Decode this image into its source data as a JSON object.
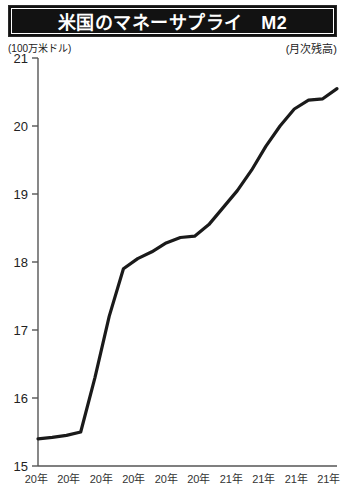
{
  "header": {
    "title": "米国のマネーサプライ　M2",
    "unit_left": "(100万米ドル)",
    "unit_right": "(月次残高)"
  },
  "colors": {
    "title_bar_bg": "#121212",
    "title_text": "#ffffff",
    "line": "#1a1a1a",
    "axis": "#555555",
    "page_bg": "#ffffff"
  },
  "chart_data": {
    "type": "line",
    "title": "米国のマネーサプライ　M2",
    "xlabel": "",
    "ylabel": "(100万米ドル)",
    "note": "(月次残高)",
    "ylim": [
      15,
      21
    ],
    "yticks": [
      15,
      16,
      17,
      18,
      19,
      20,
      21
    ],
    "ytick_labels": [
      "15",
      "16",
      "17",
      "18",
      "19",
      "20",
      "21"
    ],
    "grid": false,
    "legend": "none",
    "xtick_labels": [
      "20年",
      "20年",
      "20年",
      "20年",
      "20年",
      "20年",
      "21年",
      "21年",
      "21年",
      "21年"
    ],
    "x": [
      0,
      1,
      2,
      3,
      4,
      5,
      6,
      7,
      8,
      9,
      10,
      11,
      12,
      13,
      14,
      15,
      16,
      17,
      18,
      19,
      20,
      21
    ],
    "values": [
      15.4,
      15.42,
      15.45,
      15.5,
      16.3,
      17.2,
      17.9,
      18.05,
      18.15,
      18.28,
      18.36,
      18.38,
      18.55,
      18.8,
      19.05,
      19.35,
      19.7,
      20.0,
      20.25,
      20.38,
      20.4,
      20.55
    ],
    "series": [
      {
        "name": "M2",
        "values": [
          15.4,
          15.42,
          15.45,
          15.5,
          16.3,
          17.2,
          17.9,
          18.05,
          18.15,
          18.28,
          18.36,
          18.38,
          18.55,
          18.8,
          19.05,
          19.35,
          19.7,
          20.0,
          20.25,
          20.38,
          20.4,
          20.55
        ]
      }
    ]
  }
}
